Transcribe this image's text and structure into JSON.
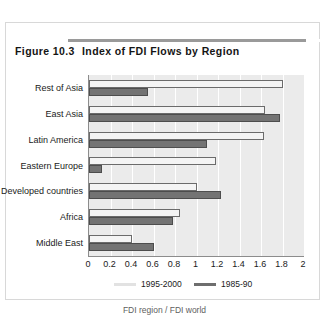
{
  "figure": {
    "number": "Figure 10.3",
    "title": "Index of FDI Flows by Region"
  },
  "footnote": "FDI region / FDI world",
  "colors": {
    "series_1995_2000": "#f4f4f4",
    "series_1985_90": "#737373",
    "plot_background": "#ebebeb",
    "gridline": "#ffffff",
    "axis": "#8c8c8c",
    "frame": "#d8d8d8"
  },
  "chart_data": {
    "type": "bar",
    "orientation": "horizontal",
    "title": "Index of FDI Flows by Region",
    "xlabel": "",
    "ylabel": "",
    "xlim": [
      0,
      2
    ],
    "xticks": [
      "0",
      "0.2",
      "0.4",
      "0.6",
      "0.8",
      "1",
      "1.2",
      "1.4",
      "1.6",
      "1.8",
      "2"
    ],
    "xtick_values": [
      0,
      0.2,
      0.4,
      0.6,
      0.8,
      1,
      1.2,
      1.4,
      1.6,
      1.8,
      2
    ],
    "grid": true,
    "legend_position": "bottom",
    "categories": [
      "Rest of Asia",
      "East Asia",
      "Latin America",
      "Eastern Europe",
      "Developed countries",
      "Africa",
      "Middle East"
    ],
    "series": [
      {
        "name": "1995-2000",
        "color": "#f4f4f4",
        "values": [
          1.8,
          1.64,
          1.63,
          1.18,
          1.0,
          0.85,
          0.4
        ]
      },
      {
        "name": "1985-90",
        "color": "#737373",
        "values": [
          0.55,
          1.78,
          1.1,
          0.12,
          1.23,
          0.78,
          0.6
        ]
      }
    ]
  }
}
